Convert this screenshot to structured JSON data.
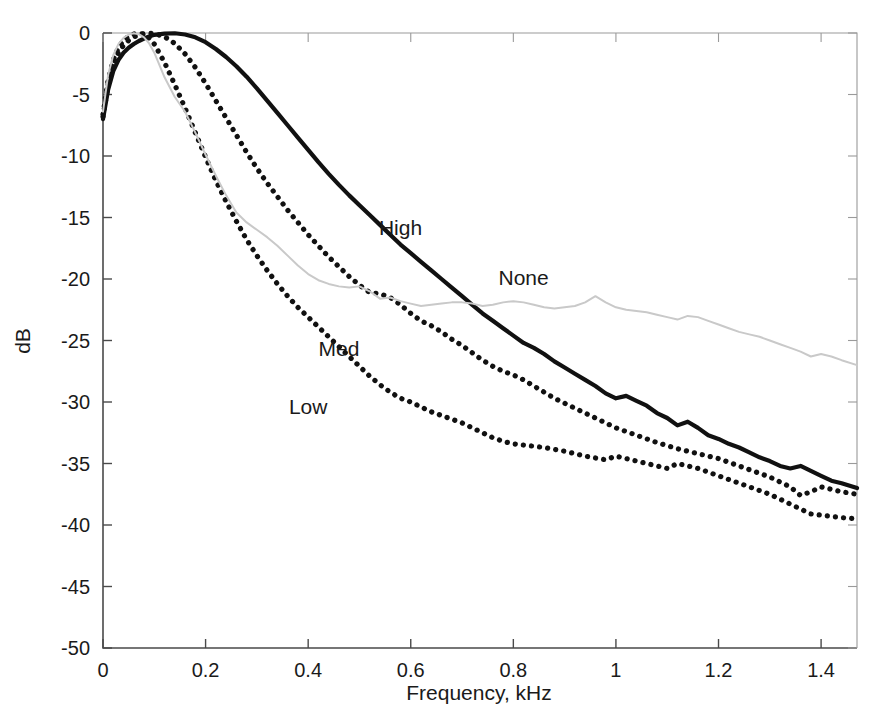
{
  "chart_data": {
    "type": "line",
    "title": "",
    "xlabel": "Frequency, kHz",
    "ylabel": "dB",
    "xlim": [
      0,
      1.47
    ],
    "ylim": [
      -50,
      0
    ],
    "grid": false,
    "legend_position": "inline-annotations",
    "xticks": [
      "0",
      "0.2",
      "0.4",
      "0.6",
      "0.8",
      "1",
      "1.2",
      "1.4"
    ],
    "xtick_values": [
      0,
      0.2,
      0.4,
      0.6,
      0.8,
      1,
      1.2,
      1.4
    ],
    "yticks": [
      "0",
      "-5",
      "-10",
      "-15",
      "-20",
      "-25",
      "-30",
      "-35",
      "-40",
      "-45",
      "-50"
    ],
    "ytick_values": [
      0,
      -5,
      -10,
      -15,
      -20,
      -25,
      -30,
      -35,
      -40,
      -45,
      -50
    ],
    "series": [
      {
        "name": "High",
        "style": "solid",
        "color": "#111111",
        "width": 4.2,
        "label_x": 0.58,
        "label_y": -16.4,
        "x": [
          0.0,
          0.01,
          0.02,
          0.03,
          0.04,
          0.05,
          0.06,
          0.07,
          0.08,
          0.09,
          0.1,
          0.12,
          0.14,
          0.16,
          0.18,
          0.2,
          0.22,
          0.24,
          0.26,
          0.28,
          0.3,
          0.32,
          0.34,
          0.36,
          0.38,
          0.4,
          0.42,
          0.44,
          0.46,
          0.48,
          0.5,
          0.52,
          0.54,
          0.56,
          0.58,
          0.6,
          0.62,
          0.64,
          0.66,
          0.68,
          0.7,
          0.72,
          0.74,
          0.76,
          0.78,
          0.8,
          0.82,
          0.84,
          0.86,
          0.88,
          0.9,
          0.92,
          0.94,
          0.96,
          0.98,
          1.0,
          1.02,
          1.04,
          1.06,
          1.08,
          1.1,
          1.12,
          1.14,
          1.16,
          1.18,
          1.2,
          1.22,
          1.24,
          1.26,
          1.28,
          1.3,
          1.32,
          1.34,
          1.36,
          1.38,
          1.4,
          1.42,
          1.44,
          1.47
        ],
        "y": [
          -7.0,
          -4.6,
          -3.1,
          -2.2,
          -1.6,
          -1.2,
          -0.9,
          -0.65,
          -0.45,
          -0.28,
          -0.15,
          -0.05,
          -0.02,
          -0.12,
          -0.35,
          -0.75,
          -1.3,
          -1.95,
          -2.7,
          -3.55,
          -4.5,
          -5.5,
          -6.5,
          -7.5,
          -8.5,
          -9.5,
          -10.5,
          -11.45,
          -12.35,
          -13.2,
          -14.0,
          -14.8,
          -15.6,
          -16.4,
          -17.2,
          -17.9,
          -18.6,
          -19.3,
          -20.0,
          -20.7,
          -21.4,
          -22.1,
          -22.8,
          -23.4,
          -24.0,
          -24.6,
          -25.2,
          -25.6,
          -26.1,
          -26.7,
          -27.2,
          -27.7,
          -28.2,
          -28.7,
          -29.3,
          -29.7,
          -29.5,
          -29.9,
          -30.3,
          -30.9,
          -31.3,
          -31.9,
          -31.6,
          -32.1,
          -32.7,
          -33.0,
          -33.4,
          -33.7,
          -34.1,
          -34.5,
          -34.8,
          -35.2,
          -35.4,
          -35.2,
          -35.6,
          -36.0,
          -36.4,
          -36.6,
          -37.0
        ]
      },
      {
        "name": "Med",
        "style": "dotted",
        "color": "#111111",
        "width": 5.2,
        "label_x": 0.46,
        "label_y": -26.3,
        "x": [
          0.0,
          0.01,
          0.02,
          0.03,
          0.04,
          0.05,
          0.06,
          0.07,
          0.08,
          0.09,
          0.1,
          0.12,
          0.14,
          0.16,
          0.18,
          0.2,
          0.22,
          0.24,
          0.26,
          0.28,
          0.3,
          0.32,
          0.34,
          0.36,
          0.38,
          0.4,
          0.42,
          0.44,
          0.46,
          0.48,
          0.5,
          0.52,
          0.54,
          0.56,
          0.58,
          0.6,
          0.62,
          0.64,
          0.66,
          0.68,
          0.7,
          0.72,
          0.74,
          0.76,
          0.78,
          0.8,
          0.82,
          0.84,
          0.86,
          0.88,
          0.9,
          0.92,
          0.94,
          0.96,
          0.98,
          1.0,
          1.02,
          1.04,
          1.06,
          1.08,
          1.1,
          1.12,
          1.14,
          1.16,
          1.18,
          1.2,
          1.22,
          1.24,
          1.26,
          1.28,
          1.3,
          1.32,
          1.34,
          1.36,
          1.38,
          1.4,
          1.42,
          1.44,
          1.47
        ],
        "y": [
          -6.8,
          -4.2,
          -2.6,
          -1.6,
          -1.0,
          -0.6,
          -0.32,
          -0.16,
          -0.06,
          -0.02,
          -0.05,
          -0.3,
          -0.85,
          -1.7,
          -2.8,
          -4.1,
          -5.5,
          -6.9,
          -8.3,
          -9.7,
          -11.0,
          -12.2,
          -13.3,
          -14.4,
          -15.4,
          -16.4,
          -17.3,
          -18.2,
          -19.0,
          -19.8,
          -20.5,
          -21.1,
          -21.2,
          -21.5,
          -22.1,
          -22.8,
          -23.4,
          -23.8,
          -24.3,
          -24.9,
          -25.4,
          -26.0,
          -26.6,
          -27.1,
          -27.5,
          -27.8,
          -28.2,
          -28.7,
          -29.2,
          -29.7,
          -30.1,
          -30.5,
          -30.9,
          -31.3,
          -31.7,
          -32.1,
          -32.4,
          -32.7,
          -33.0,
          -33.3,
          -33.55,
          -33.8,
          -34.0,
          -34.2,
          -34.4,
          -34.6,
          -34.9,
          -35.2,
          -35.5,
          -35.8,
          -36.1,
          -36.5,
          -36.9,
          -37.6,
          -37.3,
          -36.9,
          -37.1,
          -37.3,
          -37.5
        ]
      },
      {
        "name": "Low",
        "style": "dotted",
        "color": "#111111",
        "width": 5.2,
        "label_x": 0.4,
        "label_y": -31.0,
        "x": [
          0.0,
          0.01,
          0.02,
          0.03,
          0.04,
          0.05,
          0.06,
          0.07,
          0.08,
          0.09,
          0.1,
          0.12,
          0.14,
          0.16,
          0.18,
          0.2,
          0.22,
          0.24,
          0.26,
          0.28,
          0.3,
          0.32,
          0.34,
          0.36,
          0.38,
          0.4,
          0.42,
          0.44,
          0.46,
          0.48,
          0.5,
          0.52,
          0.54,
          0.56,
          0.58,
          0.6,
          0.62,
          0.64,
          0.66,
          0.68,
          0.7,
          0.72,
          0.74,
          0.76,
          0.78,
          0.8,
          0.82,
          0.84,
          0.86,
          0.88,
          0.9,
          0.92,
          0.94,
          0.96,
          0.98,
          1.0,
          1.02,
          1.04,
          1.06,
          1.08,
          1.1,
          1.12,
          1.14,
          1.16,
          1.18,
          1.2,
          1.22,
          1.24,
          1.26,
          1.28,
          1.3,
          1.32,
          1.34,
          1.36,
          1.38,
          1.4,
          1.42,
          1.44,
          1.47
        ],
        "y": [
          -6.6,
          -3.8,
          -2.2,
          -1.2,
          -0.6,
          -0.25,
          -0.08,
          -0.02,
          -0.1,
          -0.4,
          -0.9,
          -2.4,
          -4.2,
          -6.1,
          -8.1,
          -10.1,
          -12.0,
          -13.7,
          -15.3,
          -16.8,
          -18.1,
          -19.3,
          -20.4,
          -21.4,
          -22.3,
          -23.1,
          -23.9,
          -24.7,
          -25.5,
          -26.3,
          -27.1,
          -27.9,
          -28.6,
          -29.2,
          -29.7,
          -30.0,
          -30.4,
          -30.8,
          -31.1,
          -31.4,
          -31.7,
          -32.1,
          -32.5,
          -32.9,
          -33.2,
          -33.4,
          -33.5,
          -33.6,
          -33.7,
          -33.85,
          -34.0,
          -34.2,
          -34.4,
          -34.55,
          -34.7,
          -34.4,
          -34.6,
          -34.8,
          -35.0,
          -35.2,
          -35.4,
          -35.0,
          -35.2,
          -35.4,
          -35.7,
          -36.0,
          -36.3,
          -36.6,
          -36.9,
          -37.2,
          -37.5,
          -37.9,
          -38.3,
          -38.7,
          -39.1,
          -39.2,
          -39.3,
          -39.4,
          -39.5
        ]
      },
      {
        "name": "None",
        "style": "solid",
        "color": "#c9c9c9",
        "width": 2.0,
        "label_x": 0.82,
        "label_y": -20.5,
        "x": [
          0.0,
          0.01,
          0.02,
          0.03,
          0.04,
          0.05,
          0.06,
          0.07,
          0.08,
          0.09,
          0.1,
          0.12,
          0.14,
          0.16,
          0.18,
          0.2,
          0.22,
          0.24,
          0.26,
          0.28,
          0.3,
          0.32,
          0.34,
          0.36,
          0.38,
          0.4,
          0.42,
          0.44,
          0.46,
          0.48,
          0.5,
          0.52,
          0.54,
          0.56,
          0.58,
          0.6,
          0.62,
          0.64,
          0.66,
          0.68,
          0.7,
          0.72,
          0.74,
          0.76,
          0.78,
          0.8,
          0.82,
          0.84,
          0.86,
          0.88,
          0.9,
          0.92,
          0.94,
          0.96,
          0.98,
          1.0,
          1.02,
          1.04,
          1.06,
          1.08,
          1.1,
          1.12,
          1.14,
          1.16,
          1.18,
          1.2,
          1.22,
          1.24,
          1.26,
          1.28,
          1.3,
          1.32,
          1.34,
          1.36,
          1.38,
          1.4,
          1.42,
          1.44,
          1.47
        ],
        "y": [
          -6.4,
          -3.4,
          -1.8,
          -0.9,
          -0.4,
          -0.12,
          -0.02,
          -0.1,
          -0.35,
          -0.85,
          -1.6,
          -3.6,
          -5.2,
          -6.4,
          -8.1,
          -9.9,
          -11.6,
          -13.2,
          -14.6,
          -15.4,
          -16.0,
          -16.6,
          -17.3,
          -18.1,
          -18.9,
          -19.6,
          -20.1,
          -20.4,
          -20.6,
          -20.7,
          -20.6,
          -21.0,
          -21.6,
          -21.5,
          -21.8,
          -22.0,
          -22.2,
          -22.1,
          -22.0,
          -21.9,
          -21.9,
          -22.0,
          -22.2,
          -22.1,
          -21.9,
          -21.8,
          -21.9,
          -22.1,
          -22.3,
          -22.4,
          -22.3,
          -22.2,
          -21.9,
          -21.4,
          -21.9,
          -22.3,
          -22.5,
          -22.6,
          -22.7,
          -22.9,
          -23.1,
          -23.3,
          -23.0,
          -23.1,
          -23.4,
          -23.7,
          -24.0,
          -24.3,
          -24.5,
          -24.7,
          -25.0,
          -25.3,
          -25.6,
          -25.9,
          -26.3,
          -26.1,
          -26.3,
          -26.6,
          -27.0
        ]
      }
    ]
  },
  "figure": {
    "background": "#ffffff",
    "axis_color": "#4a4a4a",
    "text_color": "#1a1a1a"
  }
}
